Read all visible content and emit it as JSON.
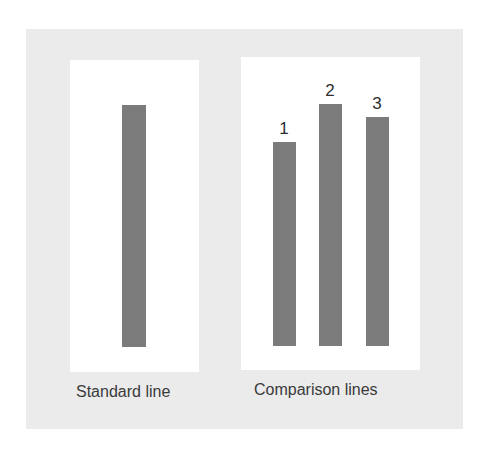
{
  "colors": {
    "background": "#ffffff",
    "frame": "#ebebeb",
    "panel": "#ffffff",
    "bar": "#7b7b7b",
    "text": "#3a3a3a"
  },
  "standard": {
    "caption": "Standard line",
    "bar": {
      "relative_length": 1.0
    }
  },
  "comparison": {
    "caption": "Comparison lines",
    "bars": [
      {
        "label": "1",
        "relative_length": 0.84
      },
      {
        "label": "2",
        "relative_length": 1.0
      },
      {
        "label": "3",
        "relative_length": 0.95
      }
    ]
  }
}
